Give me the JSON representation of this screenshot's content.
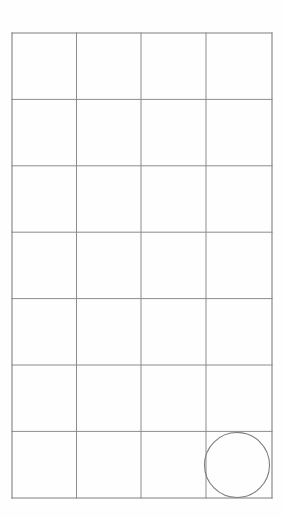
{
  "page": {
    "background_color": "#fefefe",
    "width": 284,
    "height": 517
  },
  "figure": {
    "name": "grid-with-circle",
    "line_color": "#8c8c8c",
    "outer_line_color": "#7f7f7f",
    "shape_color": "#7a7a7a",
    "line_width": 1,
    "bounds": {
      "x": 12,
      "y": 33,
      "width": 260,
      "height": 465
    },
    "grid": {
      "columns": 4,
      "rows": 7,
      "column_edges": [
        12,
        76.5,
        141,
        206,
        272
      ],
      "row_edges": [
        33,
        99.4,
        165.8,
        232.2,
        298.6,
        365,
        431.4,
        498
      ],
      "cell_width": 65,
      "cell_height": 66.43
    },
    "shapes": [
      {
        "type": "circle",
        "name": "inscribed-circle",
        "cell_column": 4,
        "cell_row": 7,
        "cx": 237,
        "cy": 465,
        "r": 32.5
      }
    ]
  }
}
